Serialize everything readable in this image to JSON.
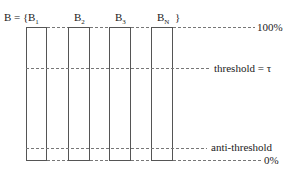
{
  "set_label": {
    "prefix": "B = {",
    "suffix": "}"
  },
  "bins": [
    {
      "name": "B",
      "sub": "1"
    },
    {
      "name": "B",
      "sub": "2"
    },
    {
      "name": "B",
      "sub": "3"
    },
    {
      "name": "B",
      "sub": "N"
    }
  ],
  "levels": {
    "top": "100%",
    "threshold": "threshold = τ",
    "anti_threshold": "anti-threshold",
    "bottom": "0%"
  },
  "colors": {
    "line": "#555555",
    "dash": "#777777",
    "text": "#222222"
  }
}
